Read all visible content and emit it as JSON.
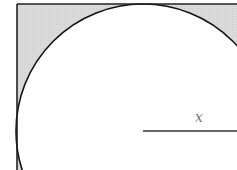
{
  "diagram": {
    "radius_label": "x",
    "colors": {
      "shade": "#d9d9d9",
      "stroke": "#111111",
      "label": "#777777"
    }
  }
}
